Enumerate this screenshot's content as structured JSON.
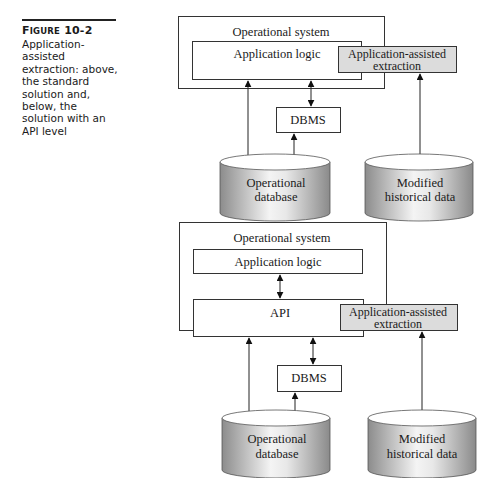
{
  "caption": {
    "label_first": "F",
    "label_smallcaps": "IGURE",
    "label_number": "10-2",
    "text": "Application-assisted extraction: above, the standard solution and, below, the solution with an API level"
  },
  "top_diagram": {
    "operational_system": "Operational system",
    "application_logic": "Application logic",
    "extraction_line1": "Application-assisted",
    "extraction_line2": "extraction",
    "dbms": "DBMS",
    "op_db_line1": "Operational",
    "op_db_line2": "database",
    "hist_line1": "Modified",
    "hist_line2": "historical data"
  },
  "bottom_diagram": {
    "operational_system": "Operational system",
    "application_logic": "Application logic",
    "api": "API",
    "extraction_line1": "Application-assisted",
    "extraction_line2": "extraction",
    "dbms": "DBMS",
    "op_db_line1": "Operational",
    "op_db_line2": "database",
    "hist_line1": "Modified",
    "hist_line2": "historical data"
  },
  "colors": {
    "extraction_fill": "#dcdcdc",
    "cylinder_dark": "#8c8c8c",
    "cylinder_light": "#f2f2f2"
  }
}
